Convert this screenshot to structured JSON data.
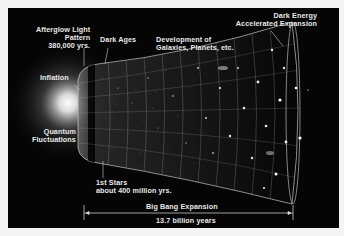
{
  "diagram": {
    "labels": {
      "afterglow": [
        "Afterglow Light",
        "Pattern",
        "380,000 yrs."
      ],
      "dark_ages": "Dark Ages",
      "development": [
        "Development of",
        "Galaxies, Planets, etc."
      ],
      "dark_energy": [
        "Dark Energy",
        "Accelerated Expansion"
      ],
      "inflation": "Inflation",
      "quantum": [
        "Quantum",
        "Fluctuations"
      ],
      "first_stars": [
        "1st Stars",
        "about 400 million yrs."
      ],
      "expansion": "Big Bang Expansion",
      "duration": "13.7 billion years"
    },
    "colors": {
      "background": "#050505",
      "text": "#e8e8e8",
      "grid": "#bfbfbf",
      "glow": "#ffffff"
    }
  }
}
